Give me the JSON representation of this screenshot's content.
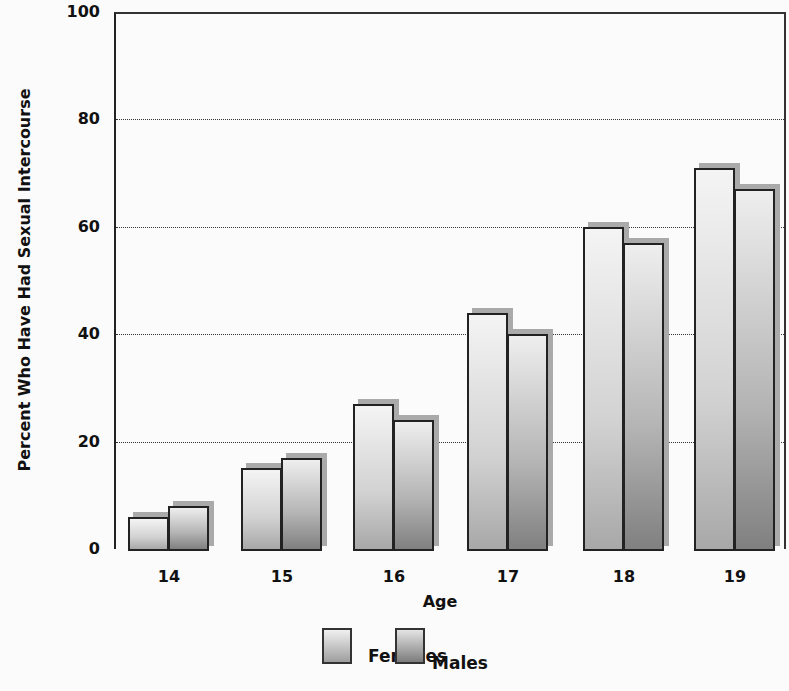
{
  "chart_data": {
    "type": "bar",
    "title": "",
    "xlabel": "Age",
    "ylabel": "Percent Who Have Had Sexual Intercourse",
    "categories": [
      "14",
      "15",
      "16",
      "17",
      "18",
      "19"
    ],
    "series": [
      {
        "name": "Females",
        "values": [
          6,
          15,
          27,
          44,
          60,
          71
        ]
      },
      {
        "name": "Males",
        "values": [
          8,
          17,
          24,
          40,
          57,
          67
        ]
      }
    ],
    "ylim": [
      0,
      100
    ],
    "yticks": [
      "0",
      "20",
      "40",
      "60",
      "80",
      "100"
    ],
    "grid": "horizontal dotted at 20, 40, 60, 80",
    "legend_position": "bottom"
  },
  "legend": {
    "females_label": "Females",
    "males_label": "Males"
  },
  "colors": {
    "females_light": "#f4f4f4",
    "females_dark": "#a8a8a8",
    "males_light": "#eeeeee",
    "males_dark": "#808080",
    "shadow": "#aaaaaa",
    "border": "#222222"
  }
}
